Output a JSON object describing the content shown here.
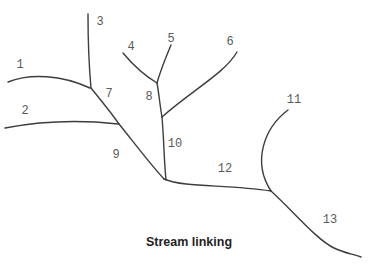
{
  "figure": {
    "caption": "Stream linking",
    "type": "stream-network-diagram"
  },
  "diagram": {
    "line_color": "#3d3d3d",
    "label_color": "#595959",
    "background_color": "#ffffff",
    "labels": [
      {
        "text": "1"
      },
      {
        "text": "2"
      },
      {
        "text": "3"
      },
      {
        "text": "4"
      },
      {
        "text": "5"
      },
      {
        "text": "6"
      },
      {
        "text": "7"
      },
      {
        "text": "8"
      },
      {
        "text": "9"
      },
      {
        "text": "10"
      },
      {
        "text": "11"
      },
      {
        "text": "12"
      },
      {
        "text": "13"
      }
    ]
  }
}
